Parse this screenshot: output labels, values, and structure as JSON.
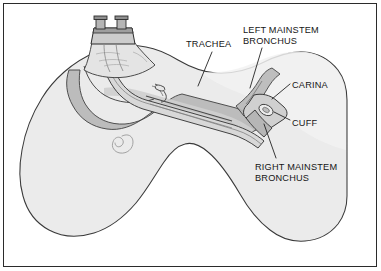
{
  "figure": {
    "border_color": "#2b2b2b",
    "background_color": "#ffffff"
  },
  "labels": [
    {
      "id": "trachea",
      "text": "TRACHEA"
    },
    {
      "id": "left_mainstem_bronchus",
      "line1": "LEFT MAINSTEM",
      "line2": "BRONCHUS"
    },
    {
      "id": "carina",
      "text": "CARINA"
    },
    {
      "id": "cuff",
      "text": "CUFF"
    },
    {
      "id": "right_mainstem_bronchus",
      "line1": "RIGHT MAINSTEM",
      "line2": "BRONCHUS"
    }
  ],
  "colors": {
    "ink": "#161616",
    "outline": "#3a3a3a",
    "lung_fill": "#ebebeb",
    "lung_fill_light": "#f2f2f2",
    "airway_shadow": "#b9b9b9",
    "airway_mid": "#cfcfcf",
    "tube_fill": "#d8d8d8",
    "tube_shade": "#a8a8a8",
    "connector_fill": "#cccccc",
    "connector_dark": "#8f8f8f",
    "white": "#ffffff"
  },
  "anatomy": [
    {
      "id": "lung-mass",
      "name": "lung silhouette with two lobes and central notch"
    },
    {
      "id": "trachea-airway",
      "name": "trachea descending to carina"
    },
    {
      "id": "endotracheal-tube",
      "name": "endotracheal tube advanced past carina"
    },
    {
      "id": "inflated-cuff",
      "name": "inflated cuff seated in right mainstem bronchus"
    },
    {
      "id": "tube-connector",
      "name": "tube connector with two prongs at proximal end"
    },
    {
      "id": "bronchiole-curl",
      "name": "small spiral marking inside left lung field"
    }
  ]
}
